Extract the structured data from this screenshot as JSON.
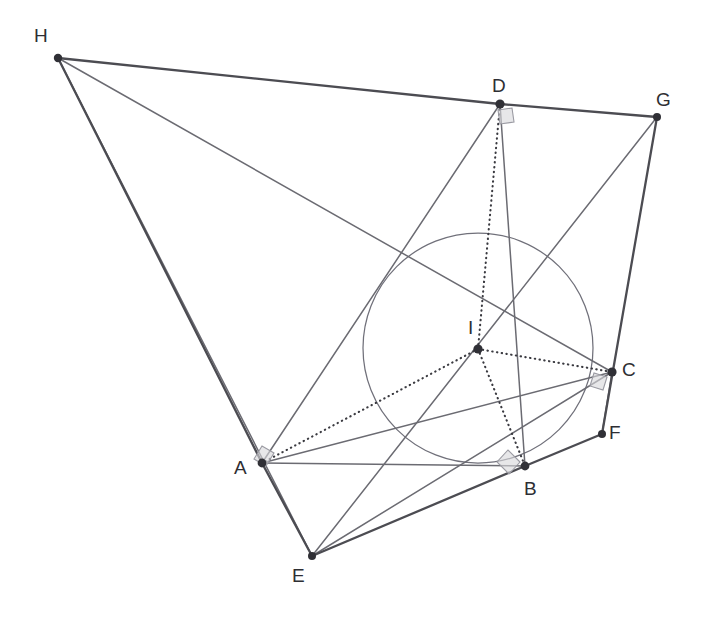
{
  "figure": {
    "kind": "geometry-diagram",
    "canvas": {
      "width": 708,
      "height": 625,
      "background": "#ffffff"
    },
    "colors": {
      "stroke_thick": "#4c4c52",
      "stroke_thin": "#6b6b72",
      "dotted": "#3a3a40",
      "circle": "#70707a",
      "vertex": "#303036",
      "right_angle_fill": "#d9d9dc",
      "right_angle_stroke": "#9a9aa2",
      "label_text": "#2e2e33"
    },
    "points": [
      {
        "id": "A",
        "label": "A",
        "x": 262,
        "y": 463,
        "label_x": 234,
        "label_y": 458
      },
      {
        "id": "B",
        "label": "B",
        "x": 525,
        "y": 466,
        "label_x": 524,
        "label_y": 479
      },
      {
        "id": "C",
        "label": "C",
        "x": 612,
        "y": 372,
        "label_x": 622,
        "label_y": 360
      },
      {
        "id": "D",
        "label": "D",
        "x": 500,
        "y": 104,
        "label_x": 492,
        "label_y": 76
      },
      {
        "id": "E",
        "label": "E",
        "x": 312,
        "y": 556,
        "label_x": 292,
        "label_y": 566
      },
      {
        "id": "F",
        "label": "F",
        "x": 602,
        "y": 434,
        "label_x": 609,
        "label_y": 423
      },
      {
        "id": "G",
        "label": "G",
        "x": 657,
        "y": 117,
        "label_x": 656,
        "label_y": 90
      },
      {
        "id": "H",
        "label": "H",
        "x": 58,
        "y": 58,
        "label_x": 34,
        "label_y": 26
      },
      {
        "id": "I",
        "label": "I",
        "x": 478,
        "y": 349,
        "label_x": 468,
        "label_y": 318
      }
    ],
    "incircle": {
      "center": "I",
      "cx": 478,
      "cy": 348,
      "r": 115
    },
    "segments_thick": [
      {
        "from": "H",
        "to": "D",
        "name": "segment-H-D"
      },
      {
        "from": "D",
        "to": "G",
        "name": "segment-D-G"
      },
      {
        "from": "G",
        "to": "F",
        "name": "segment-G-F"
      },
      {
        "from": "F",
        "to": "B",
        "name": "segment-F-B"
      },
      {
        "from": "B",
        "to": "E",
        "name": "segment-B-E"
      },
      {
        "from": "E",
        "to": "A",
        "name": "segment-E-A"
      },
      {
        "from": "A",
        "to": "H",
        "name": "segment-A-H"
      }
    ],
    "segments_thin": [
      {
        "from": "H",
        "to": "C",
        "name": "segment-H-C"
      },
      {
        "from": "H",
        "to": "E",
        "name": "segment-H-E"
      },
      {
        "from": "D",
        "to": "A",
        "name": "segment-D-A"
      },
      {
        "from": "D",
        "to": "B",
        "name": "segment-D-B"
      },
      {
        "from": "G",
        "to": "E",
        "name": "segment-G-E"
      },
      {
        "from": "A",
        "to": "C",
        "name": "segment-A-C"
      },
      {
        "from": "E",
        "to": "C",
        "name": "segment-E-C"
      },
      {
        "from": "C",
        "to": "F",
        "name": "segment-C-F"
      },
      {
        "from": "A",
        "to": "B",
        "name": "segment-A-B"
      }
    ],
    "segments_dotted": [
      {
        "from": "I",
        "to": "D",
        "name": "radius-I-D"
      },
      {
        "from": "I",
        "to": "A",
        "name": "radius-I-A"
      },
      {
        "from": "I",
        "to": "B",
        "name": "radius-I-B"
      },
      {
        "from": "I",
        "to": "C",
        "name": "radius-I-C"
      }
    ],
    "right_angles": [
      {
        "at": "D",
        "name": "right-angle-D",
        "cx": 506,
        "cy": 112,
        "a1": 97,
        "a2": 172
      },
      {
        "at": "A",
        "name": "right-angle-A",
        "cx": 256,
        "cy": 453,
        "a1": 305,
        "a2": 22
      },
      {
        "at": "B",
        "name": "right-angle-B",
        "cx": 516,
        "cy": 459,
        "a1": 186,
        "a2": 275
      },
      {
        "at": "C",
        "name": "right-angle-C",
        "cx": 604,
        "cy": 380,
        "a1": 190,
        "a2": 100
      }
    ]
  }
}
